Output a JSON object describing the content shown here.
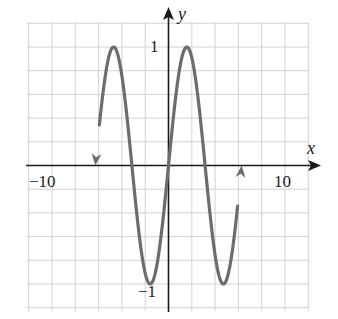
{
  "chart_data": {
    "type": "line",
    "title": "",
    "function": "y = sin(x)",
    "xlabel": "x",
    "ylabel": "y",
    "xlim": [
      -12,
      12
    ],
    "ylim": [
      -1.2,
      1.2
    ],
    "x_grid_step": 2,
    "y_grid_step": 0.2,
    "grid": true,
    "x_tick_labels": [
      {
        "value": -10,
        "label": "−10"
      },
      {
        "value": 10,
        "label": "10"
      }
    ],
    "y_tick_labels": [
      {
        "value": 1,
        "label": "1"
      },
      {
        "value": -1,
        "label": "−1"
      }
    ],
    "x_domain": [
      -6.2832,
      6.2832
    ],
    "arrows_at_ends": true,
    "series": [
      {
        "name": "sin(x)",
        "color": "#6c6c6c",
        "x": [
          -6.2832,
          -4.7124,
          -3.1416,
          -1.5708,
          0,
          1.5708,
          3.1416,
          4.7124,
          6.2832
        ],
        "y": [
          0,
          1,
          0,
          -1,
          0,
          1,
          0,
          -1,
          0
        ]
      }
    ],
    "key_points": {
      "maxima": [
        [
          -4.7124,
          1
        ],
        [
          1.5708,
          1
        ]
      ],
      "minima": [
        [
          -1.5708,
          -1
        ],
        [
          4.7124,
          -1
        ]
      ],
      "zeros": [
        -6.2832,
        -3.1416,
        0,
        3.1416,
        6.2832
      ]
    }
  },
  "labels": {
    "x_axis": "x",
    "y_axis": "y",
    "x_min": "−10",
    "x_max": "10",
    "y_max": "1",
    "y_min": "−1"
  }
}
